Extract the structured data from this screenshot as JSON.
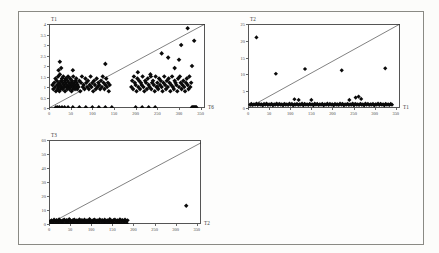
{
  "figure": {
    "background": "#fcfcfa",
    "frame_color": "#8a8a84",
    "marker_color": "#0a0a0a",
    "line_color": "#1a1a1a",
    "marker_shape": "diamond"
  },
  "charts": [
    {
      "id": "chart-t1",
      "title": "T1",
      "xlabel": "T6",
      "ylabel": "T1",
      "xticks": [
        "0",
        "50",
        "100",
        "150",
        "200",
        "250",
        "300",
        "350"
      ],
      "yticks": [
        "4",
        "3.5",
        "3",
        "2.5",
        "2",
        "1.5",
        "1",
        "0.5",
        "0"
      ]
    },
    {
      "id": "chart-t2",
      "title": "T2",
      "xlabel": "T1",
      "ylabel": "T2",
      "xticks": [
        "0",
        "50",
        "100",
        "150",
        "200",
        "250",
        "300",
        "350"
      ],
      "yticks": [
        "25",
        "20",
        "15",
        "10",
        "5",
        "0"
      ]
    },
    {
      "id": "chart-t3",
      "title": "T3",
      "xlabel": "T2",
      "ylabel": "T3",
      "xticks": [
        "0",
        "50",
        "100",
        "150",
        "200",
        "250",
        "300",
        "350"
      ],
      "yticks": [
        "60",
        "50",
        "40",
        "30",
        "20",
        "10",
        "0"
      ]
    }
  ],
  "chart_data": [
    {
      "type": "scatter",
      "title": "T1",
      "xlabel": "T6",
      "ylabel": "T1",
      "xlim": [
        0,
        360
      ],
      "ylim": [
        0,
        4
      ],
      "grid": false,
      "legend": "none",
      "annotations": [
        "diagonal reference line from (0,0) to (360,4)"
      ],
      "reference_line": {
        "x0": 0,
        "y0": 0,
        "x1": 360,
        "y1": 4
      },
      "x": [
        8,
        10,
        12,
        14,
        15,
        16,
        18,
        19,
        20,
        21,
        22,
        23,
        24,
        25,
        26,
        27,
        28,
        29,
        30,
        31,
        32,
        33,
        34,
        35,
        36,
        37,
        38,
        39,
        40,
        41,
        42,
        43,
        44,
        45,
        46,
        47,
        48,
        49,
        50,
        51,
        52,
        53,
        54,
        55,
        56,
        57,
        58,
        59,
        60,
        61,
        62,
        63,
        64,
        65,
        66,
        68,
        70,
        72,
        74,
        76,
        78,
        80,
        82,
        84,
        86,
        88,
        90,
        92,
        94,
        96,
        98,
        100,
        102,
        104,
        106,
        108,
        110,
        112,
        114,
        116,
        118,
        120,
        122,
        124,
        126,
        128,
        130,
        132,
        134,
        136,
        138,
        140,
        190,
        192,
        194,
        196,
        198,
        200,
        202,
        204,
        206,
        208,
        210,
        212,
        214,
        216,
        218,
        220,
        222,
        224,
        226,
        228,
        230,
        232,
        234,
        236,
        238,
        240,
        242,
        244,
        246,
        248,
        250,
        252,
        254,
        256,
        258,
        260,
        262,
        264,
        266,
        268,
        270,
        272,
        274,
        276,
        278,
        280,
        282,
        284,
        286,
        288,
        290,
        292,
        294,
        296,
        298,
        300,
        302,
        304,
        306,
        308,
        310,
        312,
        314,
        316,
        318,
        320,
        322,
        324,
        326,
        328,
        330,
        332,
        334,
        336,
        338,
        340,
        16,
        20,
        24,
        30,
        36,
        44,
        55,
        70,
        85,
        100,
        115,
        130,
        145,
        200,
        215,
        230,
        245,
        260,
        275,
        290,
        305,
        320,
        335,
        25,
        55,
        130,
        205,
        235,
        250,
        300,
        330,
        22,
        28,
        150,
        245,
        250,
        255,
        300,
        340
      ],
      "y": [
        1.1,
        0.9,
        1.2,
        1.0,
        1.4,
        0.8,
        1.3,
        1.1,
        0.9,
        1.5,
        1.0,
        1.2,
        0.8,
        1.6,
        1.1,
        0.9,
        1.3,
        1.0,
        1.4,
        1.2,
        0.9,
        1.5,
        1.1,
        1.0,
        1.3,
        0.8,
        1.2,
        1.4,
        1.0,
        1.1,
        0.9,
        1.3,
        1.5,
        1.0,
        1.2,
        0.9,
        1.1,
        1.4,
        1.0,
        1.2,
        0.8,
        1.3,
        1.1,
        0.9,
        1.5,
        1.0,
        1.2,
        1.1,
        0.9,
        1.3,
        1.0,
        1.4,
        1.2,
        0.9,
        1.1,
        1.0,
        1.3,
        0.8,
        1.2,
        1.5,
        1.0,
        1.1,
        0.9,
        1.4,
        1.2,
        1.0,
        1.3,
        0.9,
        1.1,
        1.5,
        1.0,
        1.2,
        0.8,
        1.3,
        1.1,
        0.9,
        1.4,
        1.0,
        1.2,
        1.1,
        0.9,
        1.3,
        1.0,
        1.5,
        1.2,
        0.9,
        1.1,
        1.4,
        1.0,
        1.2,
        0.8,
        1.1,
        1.0,
        1.3,
        0.9,
        1.5,
        1.2,
        1.1,
        0.8,
        1.4,
        1.0,
        1.3,
        0.9,
        1.2,
        1.1,
        1.5,
        1.0,
        0.8,
        1.3,
        1.2,
        0.9,
        1.4,
        1.1,
        1.0,
        1.6,
        0.9,
        1.2,
        1.3,
        1.1,
        0.8,
        1.5,
        1.0,
        1.2,
        0.9,
        1.4,
        1.1,
        1.3,
        1.0,
        0.8,
        1.2,
        1.5,
        1.1,
        0.9,
        1.3,
        1.0,
        1.4,
        1.2,
        0.8,
        1.1,
        1.5,
        1.0,
        0.9,
        1.3,
        1.2,
        1.1,
        0.8,
        1.4,
        1.0,
        1.5,
        1.2,
        0.9,
        1.1,
        1.3,
        1.0,
        0.8,
        1.2,
        1.4,
        1.1,
        0.9,
        1.5,
        1.0,
        1.2,
        0.0,
        0.0,
        0.0,
        0.0,
        0.0,
        0.0,
        0.0,
        0.0,
        0.0,
        0.0,
        0.0,
        0.0,
        0.0,
        0.0,
        0.0,
        0.0,
        0.0,
        0.0,
        0.0,
        0.0,
        0.0,
        0.0,
        0.0,
        2.6,
        2.4,
        1.9,
        3.0,
        3.8,
        3.2,
        2.2,
        1.8,
        2.1,
        1.7,
        1.5,
        1.0,
        2.3,
        2.0,
        1.8,
        1.9
      ]
    },
    {
      "type": "scatter",
      "title": "T2",
      "xlabel": "T1",
      "ylabel": "T2",
      "xlim": [
        0,
        360
      ],
      "ylim": [
        0,
        25
      ],
      "grid": false,
      "legend": "none",
      "annotations": [
        "diagonal reference line from (0,0) to (360,25)"
      ],
      "reference_line": {
        "x0": 0,
        "y0": 0,
        "x1": 360,
        "y1": 25
      },
      "x": [
        5,
        8,
        11,
        14,
        17,
        20,
        23,
        26,
        29,
        32,
        35,
        38,
        41,
        44,
        47,
        50,
        53,
        56,
        59,
        62,
        65,
        68,
        71,
        74,
        77,
        80,
        83,
        86,
        89,
        92,
        95,
        98,
        101,
        104,
        107,
        110,
        113,
        116,
        119,
        122,
        125,
        128,
        131,
        134,
        137,
        140,
        143,
        146,
        149,
        152,
        155,
        158,
        161,
        164,
        167,
        170,
        173,
        176,
        179,
        182,
        185,
        188,
        191,
        194,
        197,
        200,
        203,
        206,
        209,
        212,
        215,
        218,
        221,
        224,
        227,
        230,
        233,
        236,
        239,
        242,
        245,
        248,
        251,
        254,
        257,
        260,
        263,
        266,
        269,
        272,
        275,
        278,
        281,
        284,
        287,
        290,
        293,
        296,
        299,
        302,
        305,
        308,
        311,
        314,
        317,
        320,
        323,
        326,
        329,
        332,
        335,
        338,
        341,
        110,
        120,
        150,
        240,
        255,
        262,
        268,
        20,
        66,
        135,
        222,
        325
      ],
      "y": [
        1.0,
        1.2,
        0.9,
        1.1,
        1.0,
        1.3,
        0.9,
        1.2,
        1.0,
        1.1,
        0.8,
        1.2,
        1.0,
        1.3,
        0.9,
        1.1,
        1.0,
        1.2,
        0.8,
        1.1,
        1.0,
        1.3,
        0.9,
        1.2,
        1.0,
        1.1,
        0.8,
        1.2,
        1.0,
        1.1,
        0.9,
        1.3,
        1.0,
        1.2,
        0.8,
        1.1,
        1.0,
        1.2,
        0.9,
        1.1,
        1.0,
        1.3,
        0.8,
        1.2,
        1.0,
        1.1,
        0.9,
        1.2,
        1.0,
        1.1,
        0.8,
        1.3,
        1.0,
        1.2,
        0.9,
        1.1,
        1.0,
        1.2,
        0.8,
        1.1,
        1.0,
        1.3,
        0.9,
        1.2,
        1.0,
        1.1,
        0.8,
        1.2,
        1.0,
        1.1,
        0.9,
        1.3,
        1.0,
        1.2,
        0.8,
        1.1,
        1.0,
        1.2,
        0.9,
        1.1,
        1.0,
        1.3,
        0.8,
        1.2,
        1.0,
        1.1,
        0.9,
        1.2,
        1.0,
        1.1,
        0.8,
        1.3,
        1.0,
        1.2,
        0.9,
        1.1,
        1.0,
        1.2,
        0.8,
        1.1,
        1.0,
        1.3,
        0.9,
        1.2,
        1.0,
        1.1,
        0.8,
        1.2,
        1.0,
        1.1,
        0.9,
        1.2,
        1.0,
        2.6,
        2.4,
        2.4,
        2.4,
        3.1,
        3.4,
        2.7,
        21.0,
        10.2,
        11.6,
        11.2,
        11.8
      ]
    },
    {
      "type": "scatter",
      "title": "T3",
      "xlabel": "T2",
      "ylabel": "T3",
      "xlim": [
        0,
        360
      ],
      "ylim": [
        0,
        60
      ],
      "grid": false,
      "legend": "none",
      "annotations": [
        "diagonal reference line from (0,0) to (360,58)"
      ],
      "reference_line": {
        "x0": 0,
        "y0": 0,
        "x1": 360,
        "y1": 58
      },
      "x": [
        3,
        6,
        9,
        12,
        15,
        18,
        21,
        24,
        27,
        30,
        33,
        36,
        39,
        42,
        45,
        48,
        51,
        54,
        57,
        60,
        63,
        66,
        69,
        72,
        75,
        78,
        81,
        84,
        87,
        90,
        93,
        96,
        99,
        102,
        105,
        108,
        111,
        114,
        117,
        120,
        123,
        126,
        129,
        132,
        135,
        138,
        141,
        144,
        147,
        150,
        153,
        156,
        159,
        162,
        165,
        168,
        171,
        174,
        177,
        180,
        183,
        186,
        5,
        10,
        16,
        22,
        28,
        34,
        40,
        46,
        52,
        58,
        64,
        70,
        76,
        82,
        88,
        94,
        100,
        106,
        112,
        118,
        124,
        130,
        136,
        142,
        148,
        154,
        160,
        166,
        172,
        178,
        184,
        62,
        135,
        325
      ],
      "y": [
        2.0,
        2.5,
        1.8,
        3.0,
        2.2,
        2.8,
        2.0,
        3.2,
        2.4,
        2.0,
        2.6,
        3.0,
        2.2,
        2.8,
        2.0,
        3.4,
        2.4,
        2.0,
        2.8,
        3.0,
        2.2,
        2.6,
        2.0,
        3.2,
        2.4,
        2.8,
        2.0,
        3.0,
        2.2,
        2.6,
        2.0,
        3.4,
        2.4,
        2.0,
        2.8,
        3.0,
        2.2,
        2.6,
        2.0,
        3.2,
        2.4,
        2.8,
        2.0,
        3.0,
        2.2,
        2.6,
        2.0,
        3.4,
        2.4,
        2.0,
        2.8,
        3.0,
        2.2,
        2.6,
        2.0,
        3.2,
        2.4,
        2.8,
        2.0,
        3.0,
        2.2,
        2.6,
        0.6,
        0.8,
        0.5,
        0.9,
        0.6,
        0.7,
        0.5,
        0.8,
        0.6,
        0.9,
        0.5,
        0.7,
        0.6,
        0.8,
        0.5,
        0.9,
        0.6,
        0.7,
        0.5,
        0.8,
        0.6,
        0.9,
        0.5,
        0.7,
        0.6,
        0.8,
        0.5,
        0.9,
        0.6,
        0.7,
        0.5,
        0.8,
        0.6,
        13.0,
        52.0,
        1.0
      ]
    }
  ]
}
